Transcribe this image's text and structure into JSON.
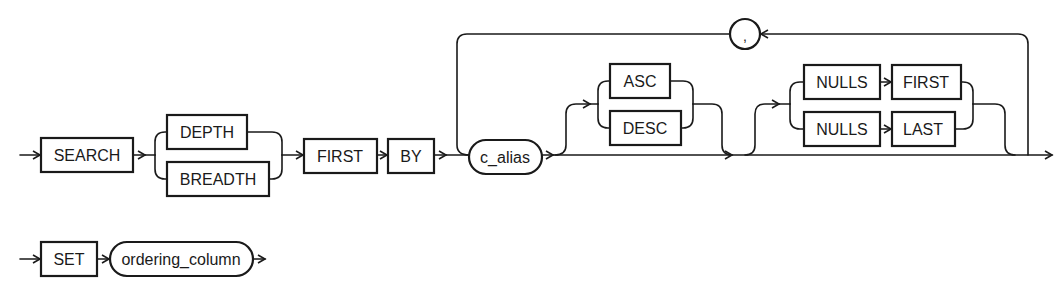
{
  "diagram": {
    "type": "railroad-syntax-diagram",
    "clause_1": {
      "keyword_search": "SEARCH",
      "order_choice": [
        "DEPTH",
        "BREADTH"
      ],
      "keyword_first": "FIRST",
      "keyword_by": "BY",
      "column_alias": "c_alias",
      "separator": ",",
      "sort_choice": [
        "ASC",
        "DESC"
      ],
      "nulls_first": {
        "nulls": "NULLS",
        "position": "FIRST"
      },
      "nulls_last": {
        "nulls": "NULLS",
        "position": "LAST"
      }
    },
    "clause_2": {
      "keyword_set": "SET",
      "column": "ordering_column"
    },
    "colors": {
      "stroke": "#1a1a1a",
      "background": "#ffffff"
    }
  }
}
